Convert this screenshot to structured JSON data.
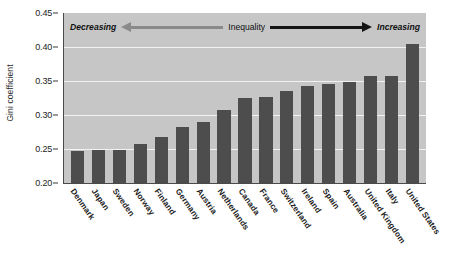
{
  "chart_data": {
    "type": "bar",
    "title": "",
    "xlabel": "",
    "ylabel": "Gini coefficient",
    "ylim": [
      0.2,
      0.45
    ],
    "ytick_labels": [
      "0.45",
      "0.40",
      "0.35",
      "0.30",
      "0.25",
      "0.20"
    ],
    "ytick_values": [
      0.45,
      0.4,
      0.35,
      0.3,
      0.25,
      0.2
    ],
    "grid": true,
    "legend": "none",
    "bar_color": "#4d4d4d",
    "plot_background": "#c6c6c6",
    "categories": [
      "Denmark",
      "Japan",
      "Sweden",
      "Norway",
      "Finland",
      "Germany",
      "Austria",
      "Netherlands",
      "Canada",
      "France",
      "Switzerland",
      "Ireland",
      "Spain",
      "Australia",
      "United Kingdom",
      "Italy",
      "United States"
    ],
    "values": [
      0.247,
      0.249,
      0.249,
      0.257,
      0.268,
      0.282,
      0.29,
      0.307,
      0.325,
      0.326,
      0.335,
      0.342,
      0.345,
      0.349,
      0.357,
      0.357,
      0.405
    ],
    "annotations": {
      "left_label": "Decreasing",
      "center_label": "Inequality",
      "right_label": "Increasing",
      "left_arrow": "left-arrow-icon",
      "right_arrow": "right-arrow-icon"
    }
  }
}
